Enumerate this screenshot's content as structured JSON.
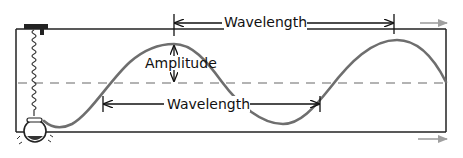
{
  "diagram": {
    "labels": {
      "wavelength_top": "Wavelength",
      "wavelength_bottom": "Wavelength",
      "amplitude": "Amplitude"
    },
    "colors": {
      "wave": "#6e6e6e",
      "frame": "#222222",
      "centerline": "#9a9a9a",
      "direction_arrows": "#a0a0a0",
      "annotation": "#111111"
    },
    "elements": [
      "frame",
      "spring",
      "weight",
      "wave",
      "equilibrium-centerline",
      "wavelength-marker-top",
      "wavelength-marker-bottom",
      "amplitude-marker",
      "direction-arrow-top",
      "direction-arrow-bottom"
    ]
  }
}
